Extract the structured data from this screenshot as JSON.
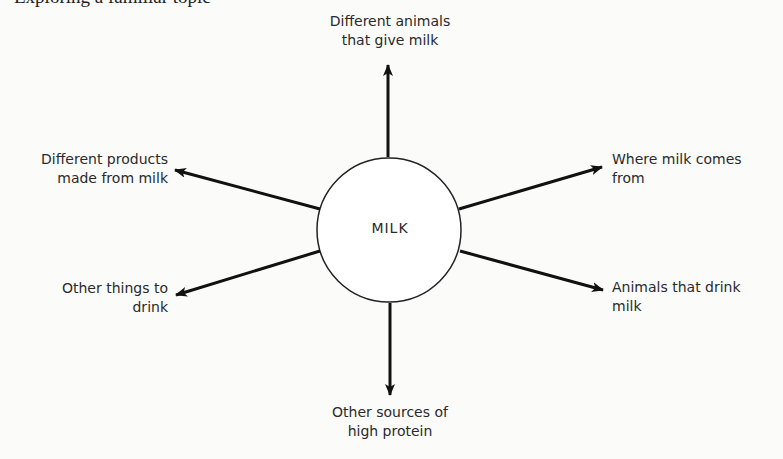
{
  "page": {
    "heading": "Exploring a familiar topic"
  },
  "diagram": {
    "center": {
      "label": "MILK"
    },
    "branches": [
      {
        "id": "top",
        "line1": "Different animals",
        "line2": "that give milk"
      },
      {
        "id": "upper-left",
        "line1": "Different products",
        "line2": "made from milk"
      },
      {
        "id": "upper-right",
        "line1": "Where milk comes",
        "line2": "from"
      },
      {
        "id": "lower-left",
        "line1": "Other things to",
        "line2": "drink"
      },
      {
        "id": "lower-right",
        "line1": "Animals that drink",
        "line2": "milk"
      },
      {
        "id": "bottom",
        "line1": "Other sources of",
        "line2": "high protein"
      }
    ],
    "colors": {
      "stroke": "#111111",
      "text": "#2a2a2a",
      "background": "#fbfbfa"
    }
  }
}
